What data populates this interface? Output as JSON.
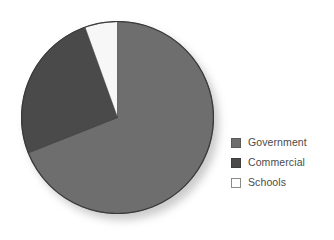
{
  "chart_data": {
    "type": "pie",
    "title": "",
    "subtitle": "",
    "xlabel": "",
    "ylabel": "",
    "grid": false,
    "legend_position": "right",
    "start_angle_deg": 0,
    "direction": "clockwise",
    "categories": [
      "Government",
      "Commercial",
      "Schools"
    ],
    "values": [
      69,
      25.5,
      5.5
    ],
    "value_unit": "percent",
    "slices": [
      {
        "label": "Government",
        "value": 69,
        "color": "#6e6e6e",
        "start_angle_deg": 0,
        "end_angle_deg": 248.4
      },
      {
        "label": "Commercial",
        "value": 25.5,
        "color": "#4a4a4a",
        "start_angle_deg": 248.4,
        "end_angle_deg": 340.2
      },
      {
        "label": "Schools",
        "value": 5.5,
        "color": "#f7f7f7",
        "start_angle_deg": 340.2,
        "end_angle_deg": 360
      }
    ],
    "annotations": []
  },
  "legend": {
    "items": [
      {
        "label": "Government",
        "color": "#6e6e6e",
        "border": "#5a5a5a"
      },
      {
        "label": "Commercial",
        "color": "#4a4a4a",
        "border": "#3d3d3d"
      },
      {
        "label": "Schools",
        "color": "#fdfdfd",
        "border": "#8a8a8a"
      }
    ]
  },
  "style": {
    "pie_outline": "#3a3a3a",
    "background": "#ffffff",
    "text_color": "#4a4a4a"
  }
}
